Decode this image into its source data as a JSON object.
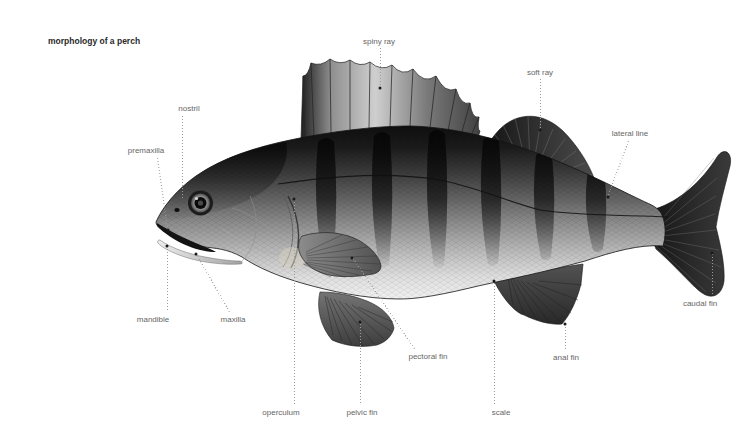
{
  "title": "morphology of a perch",
  "labels": {
    "spiny_ray": "spiny ray",
    "soft_ray": "soft ray",
    "lateral_line": "lateral line",
    "caudal_fin": "caudal fin",
    "anal_fin": "anal fin",
    "scale": "scale",
    "pelvic_fin": "pelvic fin",
    "operculum": "operculum",
    "pectoral_fin": "pectoral fin",
    "maxilla": "maxilla",
    "mandible": "mandible",
    "premaxilla": "premaxilla",
    "nostril": "nostril"
  },
  "colors": {
    "background": "#ffffff",
    "title_text": "#2a2a2a",
    "label_text": "#666666",
    "leader_line": "#9c9c9c",
    "leader_dot": "#1a1a1a",
    "fish_dark": "#0d0d0d",
    "fish_mid": "#808080",
    "fish_light": "#eeeeee",
    "pectoral_base_pale": "#d8d2c2"
  }
}
